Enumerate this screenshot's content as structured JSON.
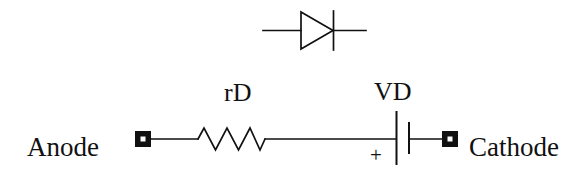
{
  "figure": {
    "background_color": "#ffffff",
    "ink_color": "#111111",
    "width": 585,
    "height": 172
  },
  "symbol": {
    "name": "diode-symbol",
    "description": "diode schematic symbol with triangle and cathode bar",
    "lead_left": "lead",
    "lead_right": "lead"
  },
  "labels": {
    "anode": "Anode",
    "cathode": "Cathode",
    "resistance": "rD",
    "voltage": "VD",
    "polarity_plus": "+"
  },
  "components": {
    "resistor": {
      "name": "rD",
      "type": "resistor",
      "zigzag_peaks": 3
    },
    "source": {
      "name": "VD",
      "type": "voltage-source",
      "polarity": "+"
    },
    "terminal_left": {
      "name": "Anode",
      "type": "terminal-node"
    },
    "terminal_right": {
      "name": "Cathode",
      "type": "terminal-node"
    }
  }
}
